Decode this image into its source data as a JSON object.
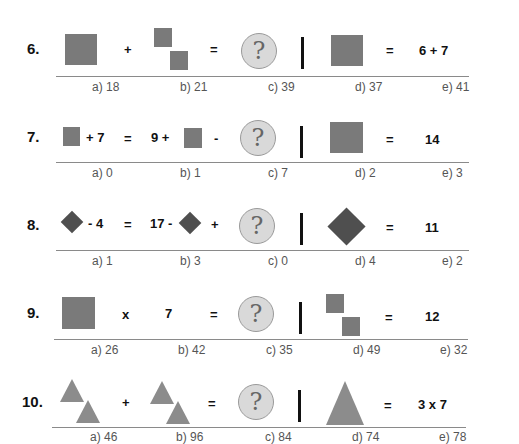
{
  "problems": [
    {
      "number": "6.",
      "op1": "+",
      "eq": "=",
      "rhs_eq": "=",
      "rhs": "6 + 7",
      "answers": [
        "a) 18",
        "b) 21",
        "c) 39",
        "d) 37",
        "e) 41"
      ]
    },
    {
      "number": "7.",
      "t1": "+ 7",
      "eq": "=",
      "t2": "9 +",
      "op2": "-",
      "rhs_eq": "=",
      "rhs": "14",
      "answers": [
        "a) 0",
        "b) 1",
        "c) 7",
        "d) 2",
        "e) 3"
      ]
    },
    {
      "number": "8.",
      "t1": "- 4",
      "eq": "=",
      "t2": "17 -",
      "op2": "+",
      "rhs_eq": "=",
      "rhs": "11",
      "answers": [
        "a) 1",
        "b) 3",
        "c) 0",
        "d) 4",
        "e) 2"
      ]
    },
    {
      "number": "9.",
      "op1": "x",
      "t2": "7",
      "eq": "=",
      "rhs_eq": "=",
      "rhs": "12",
      "answers": [
        "a) 26",
        "b) 42",
        "c) 35",
        "d) 49",
        "e) 32"
      ]
    },
    {
      "number": "10.",
      "op1": "+",
      "eq": "=",
      "rhs_eq": "=",
      "rhs": "3 x 7",
      "answers": [
        "a) 46",
        "b) 96",
        "c) 84",
        "d) 74",
        "e) 78"
      ]
    }
  ],
  "unknown_symbol": "?",
  "colors": {
    "square": "#7a7a7a",
    "diamond": "#4f4f4f",
    "triangle": "#8c8c8c",
    "unknown_circle": "#d9d9d9"
  }
}
